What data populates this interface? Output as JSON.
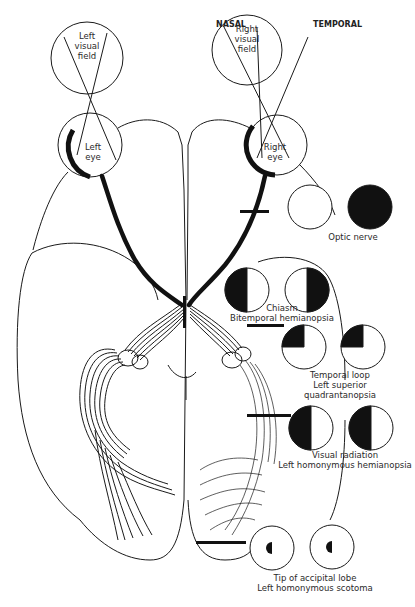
{
  "header": {
    "nasal": "NASAL",
    "temporal": "TEMPORAL"
  },
  "fields": {
    "left_visual_field": [
      "Left",
      "visual",
      "field"
    ],
    "right_visual_field": [
      "Right",
      "visual",
      "field"
    ],
    "left_eye": [
      "Left",
      "eye"
    ],
    "right_eye": [
      "Right",
      "eye"
    ]
  },
  "lesions": [
    {
      "site": "Optic nerve",
      "defect": "",
      "left_eye_field": "normal (white)",
      "right_eye_field": "complete loss (black)"
    },
    {
      "site": "Chiasm",
      "defect": "Bitemporal hemianopsia",
      "left_eye_field": "left half black",
      "right_eye_field": "right half black"
    },
    {
      "site": "Temporal loop",
      "defect": "Left superior quadrantanopsia",
      "defect_line1": "Left superior",
      "defect_line2": "quadrantanopsia",
      "left_eye_field": "upper-left quadrant black",
      "right_eye_field": "upper-left quadrant black"
    },
    {
      "site": "Visual radiation",
      "defect": "Left homonymous hemianopsia",
      "left_eye_field": "left half black",
      "right_eye_field": "left half black"
    },
    {
      "site": "Tip of accipital lobe",
      "defect": "Left homonymous scotoma",
      "left_eye_field": "small central-left half-disc black",
      "right_eye_field": "small central-left half-disc black"
    }
  ],
  "colors": {
    "ink": "#1a1a1a",
    "paper": "#ffffff",
    "text": "#2a2a2a"
  }
}
